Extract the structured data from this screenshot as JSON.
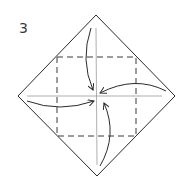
{
  "diagram": {
    "step_number": "3",
    "colors": {
      "outline": "#2a2a2a",
      "dashed_fold": "#3a3a3a",
      "crease": "#9a9a9a",
      "arrow": "#2a2a2a",
      "background": "#ffffff"
    },
    "paper": {
      "shape": "diamond",
      "vertices": {
        "top": [
          96,
          15
        ],
        "right": [
          175,
          96
        ],
        "bottom": [
          97,
          176
        ],
        "left": [
          18,
          96
        ]
      }
    },
    "fold_lines": {
      "type": "valley-fold-dashed-square",
      "corners": {
        "top_left": [
          57,
          57
        ],
        "top_right": [
          136,
          57
        ],
        "bottom_right": [
          136,
          136
        ],
        "bottom_left": [
          57,
          136
        ]
      }
    },
    "crease_lines": [
      {
        "name": "vertical-center-crease",
        "from": [
          96,
          28
        ],
        "to": [
          97,
          165
        ]
      },
      {
        "name": "horizontal-center-crease",
        "from": [
          27,
          96
        ],
        "to": [
          162,
          96
        ]
      }
    ],
    "arrows": [
      {
        "name": "fold-top-corner-arrow",
        "direction": "top-to-center"
      },
      {
        "name": "fold-right-corner-arrow",
        "direction": "right-to-center"
      },
      {
        "name": "fold-bottom-corner-arrow",
        "direction": "bottom-to-center"
      },
      {
        "name": "fold-left-corner-arrow",
        "direction": "left-to-center"
      }
    ]
  }
}
